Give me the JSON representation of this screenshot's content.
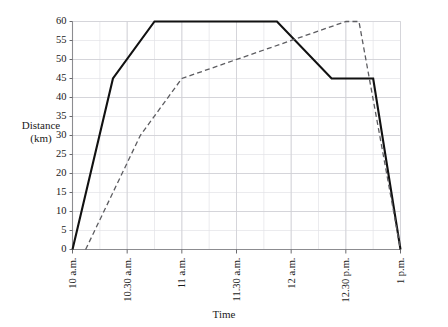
{
  "chart_data": {
    "type": "line",
    "title": "",
    "xlabel": "Time",
    "ylabel": "Distance (km)",
    "ylabel_line1": "Distance",
    "ylabel_line2": "(km)",
    "ylim": [
      0,
      60
    ],
    "ytick_step": 5,
    "yticks": [
      0,
      5,
      10,
      15,
      20,
      25,
      30,
      35,
      40,
      45,
      50,
      55,
      60
    ],
    "xlim": [
      "10 a.m.",
      "1 p.m."
    ],
    "xticks": [
      "10 a.m.",
      "10.30 a.m.",
      "11 a.m.",
      "11.30 a.m.",
      "12 a.m.",
      "12.30 p.m.",
      "1 p.m."
    ],
    "xtick_hours": [
      10,
      10.5,
      11,
      11.5,
      12,
      12.5,
      13
    ],
    "x_minor_step_hours": 0.25,
    "grid": true,
    "grid_minor": true,
    "legend": "none",
    "legend_position": "none",
    "series": [
      {
        "name": "Journey A",
        "style": "solid",
        "color": "#111111",
        "points": [
          {
            "t": 10.0,
            "label": "10 a.m.",
            "km": 0
          },
          {
            "t": 10.37,
            "label": "10.22 a.m.",
            "km": 45
          },
          {
            "t": 10.75,
            "label": "10.45 a.m.",
            "km": 60
          },
          {
            "t": 11.87,
            "label": "11.52 a.m.",
            "km": 60
          },
          {
            "t": 12.37,
            "label": "12.22 p.m.",
            "km": 45
          },
          {
            "t": 12.75,
            "label": "12.45 p.m.",
            "km": 45
          },
          {
            "t": 13.0,
            "label": "1 p.m.",
            "km": 0
          }
        ]
      },
      {
        "name": "Journey B",
        "style": "dashed",
        "color": "#5c5c60",
        "points": [
          {
            "t": 10.12,
            "label": "10.07 a.m.",
            "km": 0
          },
          {
            "t": 10.62,
            "label": "10.37 a.m.",
            "km": 30
          },
          {
            "t": 11.0,
            "label": "11 a.m.",
            "km": 45
          },
          {
            "t": 12.5,
            "label": "12.30 p.m.",
            "km": 60
          },
          {
            "t": 12.62,
            "label": "12.37 p.m.",
            "km": 60
          },
          {
            "t": 13.0,
            "label": "1 p.m.",
            "km": 0
          }
        ]
      }
    ]
  }
}
